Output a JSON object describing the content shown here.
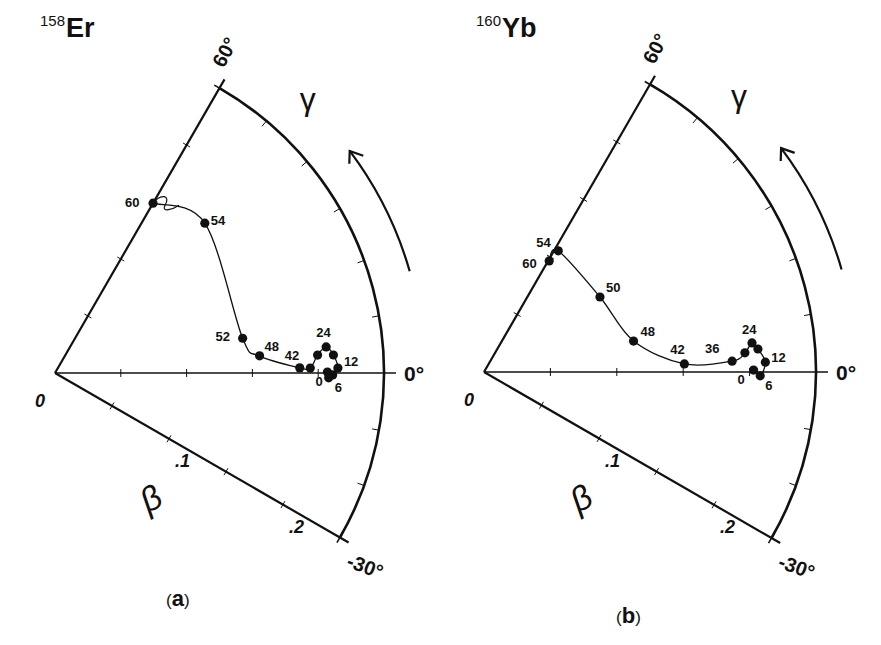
{
  "figure": {
    "type": "polar-beta-gamma-trajectory",
    "panels": [
      {
        "id": "a",
        "caption": "a",
        "nucleus": {
          "mass": "158",
          "symbol": "Er"
        },
        "origin_px": [
          55,
          373
        ],
        "radius_px": 329,
        "beta_max": 0.25,
        "arrow_gamma_range": [
          16,
          37
        ]
      },
      {
        "id": "b",
        "caption": "b",
        "nucleus": {
          "mass": "160",
          "symbol": "Yb"
        },
        "origin_px": [
          484,
          372
        ],
        "radius_px": 332,
        "beta_max": 0.25,
        "arrow_gamma_range": [
          16,
          37
        ]
      }
    ],
    "axis_labels": {
      "origin": "0",
      "gamma_top": "60°",
      "gamma_zero": "0°",
      "gamma_bottom": "-30°",
      "beta_tick_1": ".1",
      "beta_tick_2": ".2",
      "beta_symbol": "β",
      "gamma_symbol": "γ"
    },
    "colors": {
      "ink": "#111111",
      "background": "#ffffff"
    }
  },
  "chart_data": [
    {
      "type": "scatter",
      "title": "158Er",
      "subtitle": "(a)",
      "coordinate_system": "polar (beta radial, gamma angular)",
      "xlabel": "β",
      "ylabel": "γ",
      "radial_range": [
        0,
        0.25
      ],
      "radial_ticks": [
        0.05,
        0.1,
        0.15,
        0.2
      ],
      "radial_tick_labels": [
        ".1",
        ".2"
      ],
      "angular_range_deg": [
        -30,
        60
      ],
      "angular_tick_labels": [
        "60°",
        "0°",
        "-30°"
      ],
      "angular_minor_ticks_deg": [
        -20,
        -10,
        10,
        20,
        30,
        40,
        50
      ],
      "grid": false,
      "series": [
        {
          "name": "yrast trajectory (spin labels)",
          "points": [
            {
              "label": "0",
              "beta": 0.207,
              "gamma": 0.2
            },
            {
              "label": "6",
              "beta": 0.208,
              "gamma": -1.0
            },
            {
              "label": "",
              "beta": 0.211,
              "gamma": -0.4
            },
            {
              "label": "12",
              "beta": 0.215,
              "gamma": 1.0
            },
            {
              "label": "",
              "beta": 0.212,
              "gamma": 3.7
            },
            {
              "label": "24",
              "beta": 0.207,
              "gamma": 5.5
            },
            {
              "label": "",
              "beta": 0.2,
              "gamma": 3.9
            },
            {
              "label": "",
              "beta": 0.194,
              "gamma": 1.1
            },
            {
              "label": "42",
              "beta": 0.186,
              "gamma": 1.2
            },
            {
              "label": "48",
              "beta": 0.156,
              "gamma": 4.8
            },
            {
              "label": "52",
              "beta": 0.145,
              "gamma": 10.5
            },
            {
              "label": "54",
              "beta": 0.161,
              "gamma": 45.0
            },
            {
              "label": "60",
              "beta": 0.149,
              "gamma": 60.0
            }
          ]
        }
      ],
      "annotations": [
        "γ arrow indicating increasing γ (counter-clockwise)"
      ]
    },
    {
      "type": "scatter",
      "title": "160Yb",
      "subtitle": "(b)",
      "coordinate_system": "polar (beta radial, gamma angular)",
      "xlabel": "β",
      "ylabel": "γ",
      "radial_range": [
        0,
        0.25
      ],
      "radial_ticks": [
        0.05,
        0.1,
        0.15,
        0.2
      ],
      "radial_tick_labels": [
        ".1",
        ".2"
      ],
      "angular_range_deg": [
        -30,
        60
      ],
      "angular_tick_labels": [
        "60°",
        "0°",
        "-30°"
      ],
      "angular_minor_ticks_deg": [
        -20,
        -10,
        10,
        20,
        30,
        40,
        50
      ],
      "grid": false,
      "series": [
        {
          "name": "yrast trajectory (spin labels)",
          "points": [
            {
              "label": "0",
              "beta": 0.203,
              "gamma": 0.4
            },
            {
              "label": "6",
              "beta": 0.208,
              "gamma": -0.8
            },
            {
              "label": "12",
              "beta": 0.212,
              "gamma": 2.0
            },
            {
              "label": "",
              "beta": 0.207,
              "gamma": 4.8
            },
            {
              "label": "24",
              "beta": 0.203,
              "gamma": 6.2
            },
            {
              "label": "",
              "beta": 0.197,
              "gamma": 4.2
            },
            {
              "label": "36",
              "beta": 0.187,
              "gamma": 2.5
            },
            {
              "label": "42",
              "beta": 0.151,
              "gamma": 2.3
            },
            {
              "label": "48",
              "beta": 0.115,
              "gamma": 11.7
            },
            {
              "label": "50",
              "beta": 0.104,
              "gamma": 32.9
            },
            {
              "label": "54",
              "beta": 0.107,
              "gamma": 58.5
            },
            {
              "label": "60",
              "beta": 0.097,
              "gamma": 59.6
            }
          ]
        }
      ],
      "annotations": [
        "γ arrow indicating increasing γ (counter-clockwise)"
      ]
    }
  ]
}
